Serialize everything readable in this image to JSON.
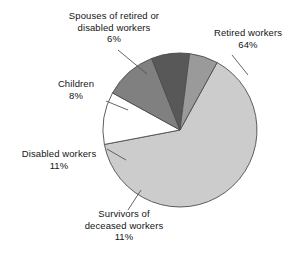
{
  "chart_data": {
    "type": "pie",
    "title": "",
    "xlabel": "",
    "ylabel": "",
    "legend_position": "none",
    "grid": false,
    "unit": "%",
    "total": 100,
    "categories": [
      "Retired workers",
      "Survivors of deceased workers",
      "Disabled workers",
      "Children",
      "Spouses of retired or disabled workers"
    ],
    "values": [
      64,
      11,
      11,
      8,
      6
    ],
    "slices": [
      {
        "name": "Retired workers",
        "label_line1": "Retired workers",
        "label_line2": "64%",
        "value": 64,
        "percent_text": "64%",
        "color": "#cccccc",
        "start_angle": -61.2,
        "end_angle": 169.2
      },
      {
        "name": "Survivors of deceased workers",
        "label_line1": "Survivors of",
        "label_line2": "deceased workers",
        "label_line3": "11%",
        "value": 11,
        "percent_text": "11%",
        "color": "#ffffff",
        "start_angle": 169.2,
        "end_angle": 208.8
      },
      {
        "name": "Disabled workers",
        "label_line1": "Disabled workers",
        "label_line2": "11%",
        "value": 11,
        "percent_text": "11%",
        "color": "#808080",
        "start_angle": 208.8,
        "end_angle": 248.4
      },
      {
        "name": "Children",
        "label_line1": "Children",
        "label_line2": "8%",
        "value": 8,
        "percent_text": "8%",
        "color": "#585858",
        "start_angle": 248.4,
        "end_angle": 277.2
      },
      {
        "name": "Spouses of retired or disabled workers",
        "label_line1": "Spouses of retired or",
        "label_line2": "disabled workers",
        "label_line3": "6%",
        "value": 6,
        "percent_text": "6%",
        "color": "#9a9a9a",
        "start_angle": 277.2,
        "end_angle": 298.8
      }
    ],
    "geometry": {
      "center_x": 180,
      "center_y": 130,
      "radius": 77
    },
    "colors": {
      "background": "#ffffff",
      "outline": "#4d4d4d",
      "text": "#141414",
      "leader_line": "#555555"
    }
  }
}
